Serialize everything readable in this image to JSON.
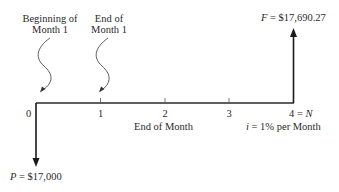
{
  "diagram": {
    "type": "cash-flow-diagram",
    "annotations": {
      "beginning": {
        "line1": "Beginning of",
        "line2": "Month 1"
      },
      "end": {
        "line1": "End of",
        "line2": "Month 1"
      }
    },
    "timeline": {
      "ticks": [
        "0",
        "1",
        "2",
        "3"
      ],
      "last_tick_num": "4 = ",
      "last_tick_var": "N",
      "axis_caption": "End of Month",
      "rate_var": "i",
      "rate_text": " = 1% per Month"
    },
    "cash_flows": {
      "present": {
        "var": "P",
        "value_text": " = $17,000",
        "direction": "down",
        "period": 0
      },
      "future": {
        "var": "F",
        "value_text": " = $17,690.27",
        "direction": "up",
        "period": 4
      }
    },
    "colors": {
      "line": "#1a1a1a",
      "text": "#2a2a2a",
      "background": "#ffffff"
    }
  }
}
